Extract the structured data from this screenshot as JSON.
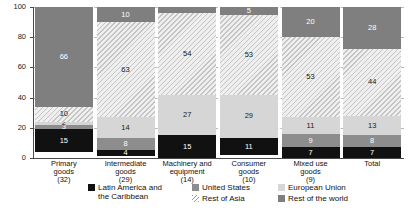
{
  "chart_data": {
    "type": "bar",
    "subtype": "stacked-bar-100",
    "title": "",
    "xlabel": "",
    "ylabel": "",
    "ylim": [
      0,
      100
    ],
    "yticks": [
      0,
      20,
      40,
      60,
      80,
      100
    ],
    "grid": true,
    "legend_position": "bottom",
    "categories": [
      "Primary goods",
      "Intermediate goods",
      "Machinery and equipment",
      "Consumer goods",
      "Mixed use goods",
      "Total"
    ],
    "category_lines": [
      [
        "Primary",
        "goods",
        "(32)"
      ],
      [
        "Intermediate",
        "goods",
        "(29)"
      ],
      [
        "Machinery and",
        "equipment",
        "(14)"
      ],
      [
        "Consumer",
        "goods",
        "(10)"
      ],
      [
        "Mixed use",
        "goods",
        "(9)"
      ],
      [
        "Total",
        "",
        ""
      ]
    ],
    "category_values": [
      "(32)",
      "(29)",
      "(14)",
      "(10)",
      "(9)",
      ""
    ],
    "series": [
      {
        "name": "Latin America and the Caribbean",
        "key": "lac",
        "color": "#111111",
        "values": [
          15,
          4,
          15,
          11,
          7,
          7
        ]
      },
      {
        "name": "United States",
        "key": "usa",
        "color": "#8d8d8d",
        "values": [
          3,
          8,
          0,
          0,
          9,
          8
        ]
      },
      {
        "name": "European Union",
        "key": "eu",
        "color": "#d6d6d6",
        "values": [
          2,
          14,
          27,
          29,
          11,
          13
        ]
      },
      {
        "name": "Rest of Asia",
        "key": "asia",
        "color": "#e8e8e8",
        "values": [
          10,
          63,
          54,
          53,
          53,
          44
        ]
      },
      {
        "name": "Rest of the world",
        "key": "row",
        "color": "#7f7f7f",
        "values": [
          66,
          10,
          4,
          5,
          20,
          28
        ]
      }
    ],
    "bars": [
      {
        "category": "Primary goods",
        "segments": [
          {
            "series": "lac",
            "value": 15,
            "label": "15"
          },
          {
            "series": "usa",
            "value": 3,
            "label": "3"
          },
          {
            "series": "eu",
            "value": 2,
            "label": "2"
          },
          {
            "series": "asia",
            "value": 10,
            "label": "10"
          },
          {
            "series": "row",
            "value": 66,
            "label": "66"
          }
        ]
      },
      {
        "category": "Intermediate goods",
        "segments": [
          {
            "series": "lac",
            "value": 4,
            "label": "4"
          },
          {
            "series": "usa",
            "value": 8,
            "label": "8"
          },
          {
            "series": "eu",
            "value": 14,
            "label": "14"
          },
          {
            "series": "asia",
            "value": 63,
            "label": "63"
          },
          {
            "series": "row",
            "value": 10,
            "label": "10"
          }
        ]
      },
      {
        "category": "Machinery and equipment",
        "segments": [
          {
            "series": "lac",
            "value": 15,
            "label": "15"
          },
          {
            "series": "eu",
            "value": 27,
            "label": "27"
          },
          {
            "series": "asia",
            "value": 54,
            "label": "54"
          },
          {
            "series": "row",
            "value": 4,
            "label": ""
          }
        ]
      },
      {
        "category": "Consumer goods",
        "segments": [
          {
            "series": "lac",
            "value": 11,
            "label": "11"
          },
          {
            "series": "eu",
            "value": 29,
            "label": "29"
          },
          {
            "series": "asia",
            "value": 53,
            "label": "53"
          },
          {
            "series": "row",
            "value": 5,
            "label": "5"
          }
        ]
      },
      {
        "category": "Mixed use goods",
        "segments": [
          {
            "series": "lac",
            "value": 7,
            "label": "7"
          },
          {
            "series": "usa",
            "value": 9,
            "label": "9"
          },
          {
            "series": "eu",
            "value": 11,
            "label": "11"
          },
          {
            "series": "asia",
            "value": 53,
            "label": "53"
          },
          {
            "series": "row",
            "value": 20,
            "label": "20"
          }
        ]
      },
      {
        "category": "Total",
        "segments": [
          {
            "series": "lac",
            "value": 7,
            "label": "7"
          },
          {
            "series": "usa",
            "value": 8,
            "label": "8"
          },
          {
            "series": "eu",
            "value": 13,
            "label": "13"
          },
          {
            "series": "asia",
            "value": 44,
            "label": "44"
          },
          {
            "series": "row",
            "value": 28,
            "label": "28"
          }
        ]
      }
    ],
    "legend": [
      {
        "key": "lac",
        "line1": "Latin America and",
        "line2": "the Caribbean"
      },
      {
        "key": "usa",
        "line1": "United States",
        "line2": ""
      },
      {
        "key": "asia",
        "line1": "Rest of Asia",
        "line2": ""
      },
      {
        "key": "eu",
        "line1": "European Union",
        "line2": ""
      },
      {
        "key": "row",
        "line1": "Rest of the world",
        "line2": ""
      }
    ]
  }
}
